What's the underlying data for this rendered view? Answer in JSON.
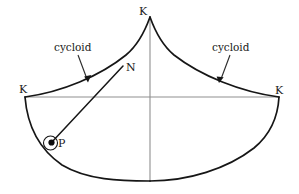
{
  "figure": {
    "background_color": "#ffffff",
    "curve_color": "#161616",
    "axis_color": "#8f8f8f",
    "label_color": "#1a1a1a",
    "labels": {
      "k_top": "K",
      "k_left": "K",
      "k_right": "K",
      "point_n": "N",
      "point_p": "P",
      "cycloid_left": "cycloid",
      "cycloid_right": "cycloid"
    },
    "geometry": {
      "cusp_top": [
        150,
        17
      ],
      "left_end": [
        25,
        97
      ],
      "right_end": [
        279,
        97
      ],
      "horizontal_axis_y": 97,
      "vertical_axis_x": 150,
      "vertical_axis_bottom_y": 181,
      "bottom_arc_lowest": [
        150,
        181
      ],
      "point_n": [
        122,
        68
      ],
      "point_p": [
        51,
        143
      ],
      "p_circle_radius": 7
    },
    "annotations": [
      {
        "name": "cycloid-left",
        "text": "cycloid",
        "text_pos": [
          54,
          42
        ],
        "arrow_from": [
          78,
          55
        ],
        "arrow_to": [
          88,
          81
        ]
      },
      {
        "name": "cycloid-right",
        "text": "cycloid",
        "text_pos": [
          213,
          42
        ],
        "arrow_from": [
          230,
          55
        ],
        "arrow_to": [
          219,
          82
        ]
      }
    ]
  }
}
